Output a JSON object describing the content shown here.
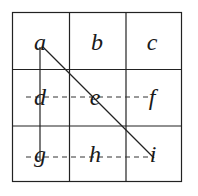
{
  "diagram": {
    "type": "grid-3x3",
    "grid": {
      "rows": 3,
      "cols": 3,
      "stroke_color": "#222222",
      "cells": [
        [
          "a",
          "b",
          "c"
        ],
        [
          "d",
          "e",
          "f"
        ],
        [
          "g",
          "h",
          "i"
        ]
      ]
    },
    "labels": {
      "a": "a",
      "b": "b",
      "c": "c",
      "d": "d",
      "e": "e",
      "f": "f",
      "g": "g",
      "h": "h",
      "i": "i"
    },
    "connections": [
      {
        "from": "a",
        "to": "g",
        "style": "solid"
      },
      {
        "from": "a",
        "to": "i",
        "style": "solid"
      },
      {
        "from": "d",
        "to": "f",
        "style": "dashed"
      },
      {
        "from": "g",
        "to": "i",
        "style": "dashed"
      }
    ]
  }
}
